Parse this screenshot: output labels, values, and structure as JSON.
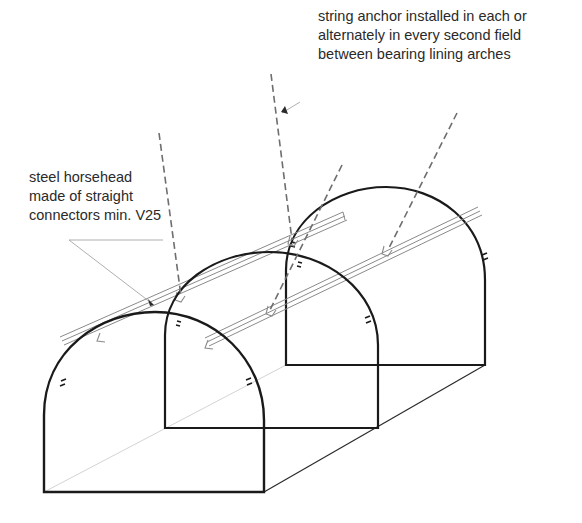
{
  "figure": {
    "type": "isometric tunnel lining diagram",
    "labels": {
      "string_anchor": {
        "lines": [
          "string anchor installed in each or",
          "alternately in every second field",
          "between bearing lining arches"
        ]
      },
      "steel_horsehead": {
        "lines": [
          "steel horsehead",
          "made of straight",
          "connectors min. V25"
        ]
      }
    },
    "components": {
      "arches": [
        "front-arch",
        "middle-arch",
        "back-arch"
      ],
      "rails": [
        "upper-rail",
        "lower-rail"
      ],
      "anchors": 4
    },
    "colors": {
      "arch_stroke": "#1a1a1a",
      "rail_stroke": "#8a8a8a",
      "anchor_dash": "#6e6e6e",
      "leader": "#9a9a9a",
      "text": "#2a2a2a",
      "background": "#ffffff"
    }
  }
}
